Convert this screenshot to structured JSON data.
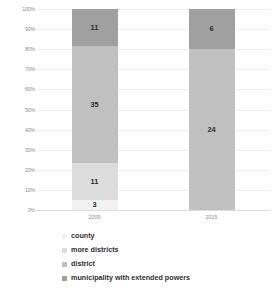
{
  "chart_data": {
    "type": "bar",
    "title": "",
    "subtitle": "",
    "xlabel": "",
    "ylabel": "",
    "stacked": true,
    "normalized": true,
    "grid": true,
    "legend_position": "bottom-left",
    "ylim": [
      0,
      100
    ],
    "categories": [
      "2009",
      "2015"
    ],
    "ytick_labels": [
      "100%",
      "90%",
      "80%",
      "70%",
      "60%",
      "50%",
      "40%",
      "30%",
      "20%",
      "10%",
      "0%"
    ],
    "ytick_values": [
      100,
      90,
      80,
      70,
      60,
      50,
      40,
      30,
      20,
      10,
      0
    ],
    "series": [
      {
        "name": "county",
        "color": "#f2f2f2",
        "values": [
          3,
          0
        ],
        "percents": [
          5.0,
          0.0
        ],
        "labels": [
          "3",
          ""
        ]
      },
      {
        "name": "more districts",
        "color": "#dcdcdc",
        "values": [
          11,
          0
        ],
        "percents": [
          18.3,
          0.0
        ],
        "labels": [
          "11",
          ""
        ]
      },
      {
        "name": "district",
        "color": "#c0c0c0",
        "values": [
          35,
          24
        ],
        "percents": [
          58.3,
          80.0
        ],
        "labels": [
          "35",
          "24"
        ]
      },
      {
        "name": "municipality with extended powers",
        "color": "#a0a0a0",
        "values": [
          11,
          6
        ],
        "percents": [
          18.3,
          20.0
        ],
        "labels": [
          "11",
          "6"
        ]
      }
    ],
    "totals": [
      60,
      30
    ]
  },
  "legend": {
    "items": [
      {
        "label": "county",
        "color": "#f2f2f2"
      },
      {
        "label": "more districts",
        "color": "#dcdcdc"
      },
      {
        "label": "district",
        "color": "#c0c0c0"
      },
      {
        "label": "municipality with extended powers",
        "color": "#a0a0a0"
      }
    ]
  }
}
